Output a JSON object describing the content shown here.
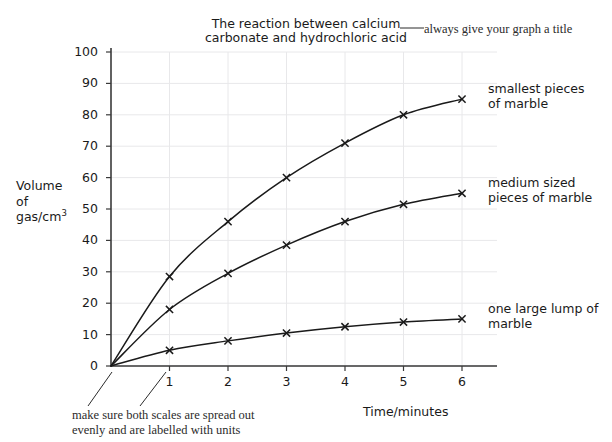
{
  "chart_data": {
    "type": "line",
    "xlabel": "Time/minutes",
    "ylabel": "Volume of gas/cm3",
    "ylabel_lines": [
      "Volume",
      "of",
      "gas/cm"
    ],
    "ylabel_superscript": "3",
    "x": [
      0,
      1,
      2,
      3,
      4,
      5,
      6
    ],
    "xlim": [
      0,
      6.4
    ],
    "ylim": [
      0,
      100
    ],
    "xticks": [
      "1",
      "2",
      "3",
      "4",
      "5",
      "6"
    ],
    "xtick_values": [
      1,
      2,
      3,
      4,
      5,
      6
    ],
    "yticks": [
      "0",
      "10",
      "20",
      "30",
      "40",
      "50",
      "60",
      "70",
      "80",
      "90",
      "100"
    ],
    "ytick_values": [
      0,
      10,
      20,
      30,
      40,
      50,
      60,
      70,
      80,
      90,
      100
    ],
    "grid": true,
    "legend_position": "right-of-curve-ends",
    "marker": "x",
    "series": [
      {
        "name": "smallest pieces of marble",
        "label_lines": [
          "smallest pieces",
          "of marble"
        ],
        "values": [
          0,
          28.5,
          46,
          60,
          71,
          80,
          85
        ],
        "color": "#1a1a1a"
      },
      {
        "name": "medium sized pieces of marble",
        "label_lines": [
          "medium sized",
          "pieces of marble"
        ],
        "values": [
          0,
          18,
          29.5,
          38.5,
          46,
          51.5,
          55
        ],
        "color": "#1a1a1a"
      },
      {
        "name": "one large lump of marble",
        "label_lines": [
          "one large lump of",
          "marble"
        ],
        "values": [
          0,
          5,
          8,
          10.5,
          12.5,
          14,
          15
        ],
        "color": "#1a1a1a"
      }
    ]
  },
  "annotations": {
    "title_note": "always give your graph a title",
    "scales_note_lines": [
      "make sure both scales are spread out",
      "evenly and are labelled with units"
    ]
  },
  "colors": {
    "ink": "#1a1a1a",
    "grid": "#e8e8ea",
    "axis": "#3a3a3a",
    "annotation": "#2b2b2b",
    "background": "#ffffff"
  }
}
